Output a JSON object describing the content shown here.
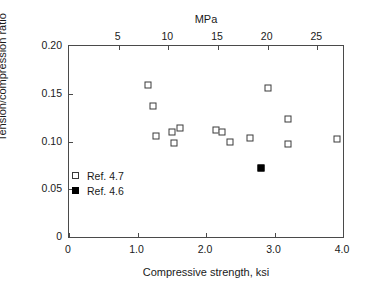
{
  "chart_data": {
    "type": "scatter",
    "title": "",
    "xlabel": "Compressive strength, ksi",
    "ylabel": "Tension/compression ratio",
    "top_axis_label": "MPa",
    "xlim": [
      0,
      4.0
    ],
    "ylim": [
      0,
      0.2
    ],
    "top_xlim": [
      0,
      27.58
    ],
    "grid": false,
    "legend_position": "inside-lower-left",
    "xticks": [
      "0",
      "1.0",
      "2.0",
      "3.0",
      "4.0"
    ],
    "xtick_values": [
      0,
      1.0,
      2.0,
      3.0,
      4.0
    ],
    "yticks": [
      "0",
      "0.05",
      "0.10",
      "0.15",
      "0.20"
    ],
    "ytick_values": [
      0,
      0.05,
      0.1,
      0.15,
      0.2
    ],
    "top_xticks": [
      "5",
      "10",
      "15",
      "20",
      "25"
    ],
    "top_xtick_values": [
      5,
      10,
      15,
      20,
      25
    ],
    "series": [
      {
        "name": "Ref. 4.7",
        "marker": "open-square",
        "color": "#3a3a3a",
        "points": [
          {
            "x": 1.15,
            "y": 0.159
          },
          {
            "x": 1.22,
            "y": 0.137
          },
          {
            "x": 1.27,
            "y": 0.106
          },
          {
            "x": 1.51,
            "y": 0.11
          },
          {
            "x": 1.62,
            "y": 0.114
          },
          {
            "x": 1.53,
            "y": 0.098
          },
          {
            "x": 2.15,
            "y": 0.112
          },
          {
            "x": 2.23,
            "y": 0.11
          },
          {
            "x": 2.35,
            "y": 0.099
          },
          {
            "x": 2.91,
            "y": 0.156
          },
          {
            "x": 2.64,
            "y": 0.104
          },
          {
            "x": 3.2,
            "y": 0.124
          },
          {
            "x": 3.2,
            "y": 0.097
          },
          {
            "x": 3.91,
            "y": 0.103
          }
        ]
      },
      {
        "name": "Ref. 4.6",
        "marker": "filled-square",
        "color": "#000000",
        "points": [
          {
            "x": 2.81,
            "y": 0.072
          }
        ]
      }
    ]
  },
  "legend": {
    "items": [
      {
        "label": "Ref. 4.7",
        "marker": "open-square"
      },
      {
        "label": "Ref. 4.6",
        "marker": "filled-square"
      }
    ]
  }
}
